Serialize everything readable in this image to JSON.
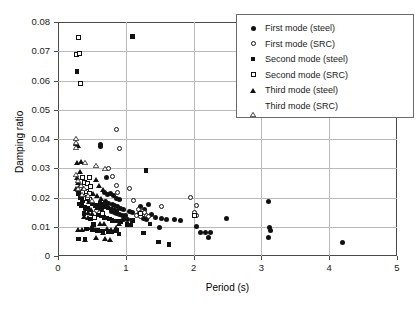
{
  "chart_data": {
    "type": "scatter",
    "title": "",
    "xlabel": "Period (s)",
    "ylabel": "Damping ratio",
    "xlim": [
      0,
      5
    ],
    "ylim": [
      0,
      0.08
    ],
    "xticks": [
      "0",
      "1",
      "2",
      "3",
      "4",
      "5"
    ],
    "yticks": [
      "0",
      "0.01",
      "0.02",
      "0.03",
      "0.04",
      "0.05",
      "0.06",
      "0.07",
      "0.08"
    ],
    "grid": true,
    "legend_position": "top-right",
    "series": [
      {
        "name": "First mode (steel)",
        "marker": "circle-filled",
        "color": "#111111",
        "points": [
          [
            0.62,
            0.0382
          ],
          [
            0.63,
            0.0375
          ],
          [
            0.72,
            0.0268
          ],
          [
            0.68,
            0.0218
          ],
          [
            0.73,
            0.0211
          ],
          [
            0.78,
            0.0212
          ],
          [
            0.82,
            0.0206
          ],
          [
            0.86,
            0.0196
          ],
          [
            0.9,
            0.0192
          ],
          [
            0.7,
            0.0185
          ],
          [
            0.75,
            0.018
          ],
          [
            0.8,
            0.0176
          ],
          [
            0.84,
            0.0172
          ],
          [
            0.88,
            0.0168
          ],
          [
            0.66,
            0.017
          ],
          [
            0.92,
            0.0163
          ],
          [
            0.96,
            0.0158
          ],
          [
            0.79,
            0.0152
          ],
          [
            0.83,
            0.0148
          ],
          [
            0.87,
            0.0145
          ],
          [
            0.91,
            0.0143
          ],
          [
            0.95,
            0.014
          ],
          [
            1.0,
            0.0138
          ],
          [
            1.05,
            0.0152
          ],
          [
            1.1,
            0.0148
          ],
          [
            1.22,
            0.017
          ],
          [
            1.27,
            0.016
          ],
          [
            1.33,
            0.0175
          ],
          [
            1.38,
            0.0143
          ],
          [
            1.26,
            0.0128
          ],
          [
            1.31,
            0.0125
          ],
          [
            1.44,
            0.013
          ],
          [
            1.52,
            0.0128
          ],
          [
            1.6,
            0.0126
          ],
          [
            1.72,
            0.0124
          ],
          [
            1.5,
            0.0098
          ],
          [
            1.8,
            0.0122
          ],
          [
            2.05,
            0.01
          ],
          [
            2.1,
            0.0082
          ],
          [
            2.18,
            0.008
          ],
          [
            2.25,
            0.0079
          ],
          [
            2.22,
            0.0062
          ],
          [
            2.48,
            0.0128
          ],
          [
            3.1,
            0.0188
          ],
          [
            3.12,
            0.0098
          ],
          [
            3.14,
            0.0086
          ],
          [
            3.1,
            0.0062
          ],
          [
            4.2,
            0.0046
          ],
          [
            1.18,
            0.0142
          ],
          [
            0.6,
            0.0165
          ],
          [
            0.64,
            0.016
          ],
          [
            0.97,
            0.0126
          ],
          [
            1.02,
            0.0124
          ]
        ]
      },
      {
        "name": "First mode (SRC)",
        "marker": "circle-open",
        "color": "#111111",
        "points": [
          [
            0.86,
            0.0432
          ],
          [
            0.9,
            0.0366
          ],
          [
            0.74,
            0.0298
          ],
          [
            0.8,
            0.0272
          ],
          [
            0.86,
            0.0242
          ],
          [
            0.88,
            0.0218
          ],
          [
            1.06,
            0.0232
          ],
          [
            1.12,
            0.019
          ],
          [
            1.18,
            0.016
          ],
          [
            1.24,
            0.0152
          ],
          [
            1.16,
            0.0138
          ],
          [
            1.22,
            0.0136
          ],
          [
            1.3,
            0.014
          ],
          [
            1.34,
            0.0136
          ],
          [
            1.28,
            0.015
          ],
          [
            1.52,
            0.0168
          ],
          [
            1.95,
            0.02
          ],
          [
            2.04,
            0.0172
          ],
          [
            2.02,
            0.0148
          ],
          [
            2.05,
            0.014
          ],
          [
            0.42,
            0.0148
          ],
          [
            0.57,
            0.0155
          ]
        ]
      },
      {
        "name": "Second mode (steel)",
        "marker": "square-filled",
        "color": "#111111",
        "points": [
          [
            1.1,
            0.075
          ],
          [
            0.28,
            0.063
          ],
          [
            1.3,
            0.0292
          ],
          [
            0.3,
            0.0212
          ],
          [
            0.33,
            0.0198
          ],
          [
            0.36,
            0.0188
          ],
          [
            0.31,
            0.0178
          ],
          [
            0.35,
            0.0172
          ],
          [
            0.4,
            0.0166
          ],
          [
            0.44,
            0.0162
          ],
          [
            0.5,
            0.0178
          ],
          [
            0.55,
            0.0172
          ],
          [
            0.58,
            0.0166
          ],
          [
            0.62,
            0.0182
          ],
          [
            0.66,
            0.0176
          ],
          [
            0.7,
            0.017
          ],
          [
            0.74,
            0.0164
          ],
          [
            0.78,
            0.016
          ],
          [
            0.82,
            0.0156
          ],
          [
            0.86,
            0.0152
          ],
          [
            0.6,
            0.014
          ],
          [
            0.64,
            0.0136
          ],
          [
            0.68,
            0.0132
          ],
          [
            0.72,
            0.013
          ],
          [
            0.76,
            0.0126
          ],
          [
            0.8,
            0.0122
          ],
          [
            0.86,
            0.012
          ],
          [
            0.92,
            0.0118
          ],
          [
            1.02,
            0.0108
          ],
          [
            1.08,
            0.0106
          ],
          [
            0.42,
            0.0092
          ],
          [
            0.5,
            0.009
          ],
          [
            0.58,
            0.0088
          ],
          [
            0.66,
            0.0086
          ],
          [
            0.74,
            0.0084
          ],
          [
            0.8,
            0.0082
          ],
          [
            0.86,
            0.0088
          ],
          [
            0.9,
            0.0076
          ],
          [
            0.3,
            0.0058
          ],
          [
            0.4,
            0.0056
          ],
          [
            1.26,
            0.0078
          ],
          [
            1.48,
            0.0048
          ],
          [
            1.64,
            0.004
          ],
          [
            1.36,
            0.011
          ],
          [
            1.1,
            0.0122
          ],
          [
            0.52,
            0.0108
          ],
          [
            0.48,
            0.0126
          ],
          [
            0.38,
            0.0146
          ]
        ]
      },
      {
        "name": "Second mode (SRC)",
        "marker": "square-open",
        "color": "#111111",
        "points": [
          [
            0.3,
            0.0748
          ],
          [
            0.28,
            0.0688
          ],
          [
            0.31,
            0.0692
          ],
          [
            0.33,
            0.059
          ],
          [
            0.36,
            0.0268
          ],
          [
            0.46,
            0.0268
          ],
          [
            0.39,
            0.0252
          ],
          [
            0.44,
            0.0248
          ],
          [
            0.48,
            0.0238
          ],
          [
            0.42,
            0.0222
          ],
          [
            0.46,
            0.0212
          ],
          [
            0.36,
            0.0218
          ],
          [
            0.4,
            0.0196
          ],
          [
            0.46,
            0.0192
          ],
          [
            0.66,
            0.0146
          ],
          [
            0.54,
            0.0132
          ],
          [
            1.22,
            0.0146
          ],
          [
            2.02,
            0.0138
          ],
          [
            0.44,
            0.02
          ]
        ]
      },
      {
        "name": "Third mode (steel)",
        "marker": "triangle-filled",
        "color": "#111111",
        "points": [
          [
            0.26,
            0.0386
          ],
          [
            0.3,
            0.0378
          ],
          [
            0.34,
            0.0322
          ],
          [
            0.28,
            0.0318
          ],
          [
            0.32,
            0.0288
          ],
          [
            0.28,
            0.0268
          ],
          [
            0.3,
            0.0252
          ],
          [
            0.33,
            0.0242
          ],
          [
            0.26,
            0.0232
          ],
          [
            0.3,
            0.0226
          ],
          [
            0.37,
            0.0232
          ],
          [
            0.56,
            0.0262
          ],
          [
            0.6,
            0.024
          ],
          [
            0.66,
            0.0228
          ],
          [
            0.52,
            0.0212
          ],
          [
            0.58,
            0.0206
          ],
          [
            0.64,
            0.0198
          ],
          [
            0.46,
            0.0186
          ],
          [
            0.52,
            0.0178
          ],
          [
            0.58,
            0.0174
          ],
          [
            0.42,
            0.0164
          ],
          [
            0.48,
            0.0158
          ],
          [
            0.44,
            0.0148
          ],
          [
            0.5,
            0.0146
          ],
          [
            0.38,
            0.0136
          ],
          [
            0.44,
            0.0132
          ],
          [
            0.3,
            0.0092
          ],
          [
            0.36,
            0.009
          ],
          [
            0.48,
            0.0096
          ],
          [
            0.54,
            0.009
          ],
          [
            0.6,
            0.0086
          ],
          [
            0.66,
            0.0082
          ],
          [
            0.72,
            0.0094
          ],
          [
            0.78,
            0.009
          ],
          [
            0.4,
            0.0056
          ],
          [
            0.56,
            0.0062
          ],
          [
            0.7,
            0.006
          ],
          [
            0.76,
            0.0058
          ],
          [
            0.86,
            0.0098
          ],
          [
            0.9,
            0.0112
          ],
          [
            0.62,
            0.011
          ],
          [
            0.68,
            0.0112
          ]
        ]
      },
      {
        "name": "Third mode (SRC)",
        "marker": "triangle-open",
        "color": "#111111",
        "points": [
          [
            0.26,
            0.0432
          ],
          [
            0.27,
            0.0418
          ],
          [
            0.26,
            0.0402
          ],
          [
            0.4,
            0.0352
          ],
          [
            0.56,
            0.034
          ],
          [
            0.7,
            0.033
          ],
          [
            0.27,
            0.0308
          ],
          [
            0.3,
            0.0288
          ],
          [
            0.34,
            0.0272
          ],
          [
            0.38,
            0.0262
          ],
          [
            0.44,
            0.0238
          ],
          [
            0.3,
            0.0262
          ],
          [
            0.5,
            0.0222
          ],
          [
            0.36,
            0.0242
          ]
        ]
      }
    ]
  },
  "legend": {
    "items": [
      {
        "label": "First mode (steel)",
        "marker": "circle-filled"
      },
      {
        "label": "First mode (SRC)",
        "marker": "circle-open"
      },
      {
        "label": "Second mode (steel)",
        "marker": "square-filled"
      },
      {
        "label": "Second mode (SRC)",
        "marker": "square-open"
      },
      {
        "label": "Third mode (steel)",
        "marker": "triangle-filled"
      },
      {
        "label": "Third mode (SRC)",
        "marker": "triangle-open"
      }
    ]
  }
}
